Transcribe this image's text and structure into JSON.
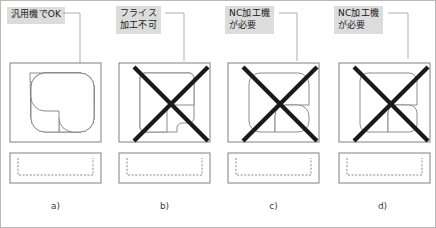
{
  "figure": {
    "title": "",
    "border_color": "#b9b9b9",
    "background": "#ffffff"
  },
  "style": {
    "outline_color": "#808080",
    "pocket_color": "#808080",
    "x_mark_color": "#1a1a1a",
    "label_bg": "#dcdcdc",
    "label_text_color": "#1a1a1a",
    "leader_color": "#9a9a9a",
    "dashed_color": "#7a7a7a"
  },
  "panels": [
    {
      "id": "a",
      "caption": "a)",
      "label": "汎用機でOK",
      "label_lines": [
        "汎用機でOK"
      ],
      "has_x_mark": false,
      "corner_radius": 14,
      "verdict": "ok"
    },
    {
      "id": "b",
      "caption": "b)",
      "label": "フライス\n加工不可",
      "label_lines": [
        "フライス",
        "加工不可"
      ],
      "has_x_mark": true,
      "corner_radius": 5,
      "verdict": "not-machinable-by-milling"
    },
    {
      "id": "c",
      "caption": "c)",
      "label": "NC加工機\nが必要",
      "label_lines": [
        "NC加工機",
        "が必要"
      ],
      "has_x_mark": true,
      "corner_radius": 11,
      "verdict": "nc-required"
    },
    {
      "id": "d",
      "caption": "d)",
      "label": "NC加工機\nが必要",
      "label_lines": [
        "NC加工機",
        "が必要"
      ],
      "has_x_mark": true,
      "corner_radius": 8,
      "verdict": "nc-required"
    }
  ]
}
